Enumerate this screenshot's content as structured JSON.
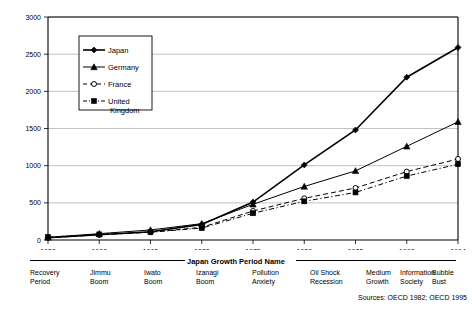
{
  "chart_data": {
    "type": "line",
    "title": "",
    "xlabel": "Japan Growth Period Name",
    "ylabel": "GDP(Billion$)",
    "x": [
      1950,
      1960,
      1965,
      1970,
      1975,
      1980,
      1985,
      1990,
      1994
    ],
    "xtick_labels": [
      "1950",
      "1960",
      "1965",
      "1970",
      "1975",
      "1980",
      "1985",
      "1990",
      "1994"
    ],
    "ytick_labels": [
      "0",
      "500",
      "1000",
      "1500",
      "2000",
      "2500",
      "3000"
    ],
    "ylim": [
      0,
      3000
    ],
    "ytick_step": 500,
    "grid": "horizontal",
    "legend_position": "upper-left-inset",
    "series": [
      {
        "name": "Japan",
        "marker": "filled-diamond",
        "line": "solid",
        "color": "#000000",
        "values": [
          30,
          70,
          110,
          210,
          510,
          1010,
          1480,
          2190,
          2590
        ]
      },
      {
        "name": "Germany",
        "marker": "filled-triangle",
        "line": "solid",
        "color": "#000000",
        "values": [
          35,
          85,
          135,
          220,
          480,
          720,
          930,
          1260,
          1590
        ]
      },
      {
        "name": "France",
        "marker": "open-circle",
        "line": "dashed",
        "color": "#000000",
        "values": [
          30,
          70,
          105,
          170,
          390,
          560,
          700,
          920,
          1090
        ]
      },
      {
        "name": "United Kingdom",
        "marker": "filled-square",
        "line": "dash-dot",
        "color": "#000000",
        "values": [
          40,
          75,
          105,
          160,
          360,
          520,
          640,
          860,
          1020
        ]
      }
    ],
    "annotations": {
      "sources": "Sources:  OECD 1982; OECD 1995"
    }
  },
  "periods": {
    "group_rules": 2,
    "items": [
      {
        "line1": "Recovery",
        "line2": "Period"
      },
      {
        "line1": "Jimmu",
        "line2": "Boom"
      },
      {
        "line1": "Iwato",
        "line2": "Boom"
      },
      {
        "line1": "Izanagi",
        "line2": "Boom"
      },
      {
        "line1": "Pollution",
        "line2": "Anxiety"
      },
      {
        "line1": "Oil Shock",
        "line2": "Recession"
      },
      {
        "line1": "Medium",
        "line2": "Growth"
      },
      {
        "line1": "Information",
        "line2": "Society"
      },
      {
        "line1": "Bubble",
        "line2": "Bust"
      }
    ]
  }
}
